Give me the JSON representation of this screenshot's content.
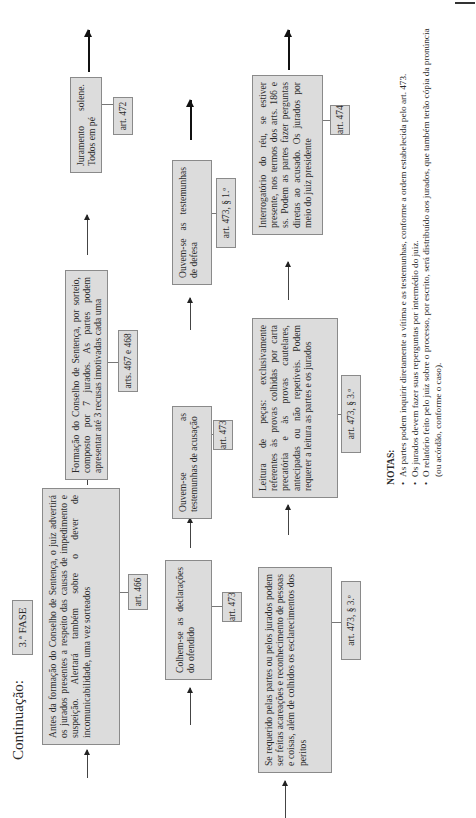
{
  "header": {
    "title": "Continuação:",
    "phase": "3.ª FASE"
  },
  "rows": [
    {
      "steps": [
        {
          "text": "Antes da formação do Conselho de Sentença, o juiz advertirá os jurados presentes a respeito das causas de impedimento e suspeição. Alertará também sobre o dever de incomunicabilidade, uma vez sorteados",
          "ref": "art. 466"
        },
        {
          "text": "Formação do Conselho de Sentença, por sorteio, composto por 7 jurados. As partes podem apresentar até 3 recusas imotivadas cada uma",
          "ref": "arts. 467 e 468"
        },
        {
          "text": "Juramento solene. Todos em pé",
          "ref": "art. 472"
        }
      ]
    },
    {
      "steps": [
        {
          "text": "Colhem-se as declarações do ofendido",
          "ref": "art. 473"
        },
        {
          "text": "Ouvem-se as testemunhas de acusação",
          "ref": "art. 473"
        },
        {
          "text": "Ouvem-se as testemunhas de defesa",
          "ref": "art. 473, § 1.º"
        }
      ]
    },
    {
      "steps": [
        {
          "text": "Se requerido pelas partes ou pelos jurados podem ser feitas acareações e reconhecimento de pessoas e coisas, além de colhidos os esclarecimentos dos peritos",
          "ref": "art. 473, § 3.º"
        },
        {
          "text": "Leitura de peças: exclusivamente referentes às provas colhidas por carta precatória e às provas cautelares, antecipadas ou não repetíveis. Podem requerer a leitura as partes e os jurados",
          "ref": "art. 473, § 3.º"
        },
        {
          "text": "Interrogatório do réu, se estiver presente, nos termos dos arts. 186 e ss. Podem as partes fazer perguntas diretas ao acusado. Os jurados por meio do juiz presidente",
          "ref": "art. 474"
        }
      ]
    }
  ],
  "notes": {
    "heading": "NOTAS:",
    "items": [
      "As partes podem inquirir diretamente a vítima e as testemunhas, conforme a ordem estabelecida pelo art. 473.",
      "Os jurados devem fazer suas reperguntas por intermédio do juiz.",
      "O relatório feito pelo juiz sobre o processo, por escrito, será distribuído aos jurados, que também terão cópia da pronúncia (ou acórdão, conforme o caso)."
    ]
  },
  "colors": {
    "box_fill": "#dcdcdc",
    "box_border": "#8a8a8a",
    "text": "#2a2a2a",
    "background": "#ffffff"
  },
  "orientation": "rotated -90deg (landscape page printed sideways)"
}
